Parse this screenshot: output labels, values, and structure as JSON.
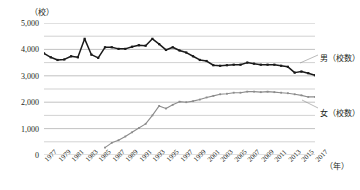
{
  "axis": {
    "unit_top": "（校）",
    "unit_right": "（年）",
    "y_ticks": [
      "5,000",
      "4,000",
      "3,000",
      "2,000",
      "1,000",
      "0"
    ],
    "y_tick_values": [
      5000,
      4000,
      3000,
      2000,
      1000,
      0
    ],
    "x_ticks": [
      "1977",
      "1979",
      "1981",
      "1983",
      "1985",
      "1987",
      "1989",
      "1991",
      "1993",
      "1995",
      "1997",
      "1999",
      "2001",
      "2003",
      "2005",
      "2007",
      "2009",
      "2011",
      "2013",
      "2015",
      "2017"
    ]
  },
  "legend": {
    "male": "男（校数）",
    "female": "女（校数）"
  },
  "colors": {
    "male_line": "#1a1a1a",
    "female_line": "#8c8c8c",
    "gridline": "#b3b3b3",
    "background": "#ffffff",
    "text": "#231f20"
  },
  "chart_data": {
    "type": "line",
    "title": "",
    "xlabel": "（年）",
    "ylabel": "（校）",
    "xlim": [
      1977,
      2017
    ],
    "ylim": [
      0,
      5000
    ],
    "grid": true,
    "grid_major_step": 1000,
    "grid_minor_step": 500,
    "legend_position": "right-inline-labels",
    "x": [
      1977,
      1978,
      1979,
      1980,
      1981,
      1982,
      1983,
      1984,
      1985,
      1986,
      1987,
      1988,
      1989,
      1990,
      1991,
      1992,
      1993,
      1994,
      1995,
      1996,
      1997,
      1998,
      1999,
      2000,
      2001,
      2002,
      2003,
      2004,
      2005,
      2006,
      2007,
      2008,
      2009,
      2010,
      2011,
      2012,
      2013,
      2014,
      2015,
      2016,
      2017
    ],
    "series": [
      {
        "name": "男（校数）",
        "color": "#1a1a1a",
        "marker": "square",
        "values": [
          3850,
          3700,
          3600,
          3620,
          3740,
          3700,
          4400,
          3800,
          3680,
          4080,
          4080,
          4020,
          4020,
          4100,
          4160,
          4140,
          4400,
          4200,
          3980,
          4080,
          3960,
          3880,
          3740,
          3600,
          3560,
          3400,
          3380,
          3400,
          3420,
          3420,
          3500,
          3460,
          3420,
          3420,
          3420,
          3380,
          3340,
          3120,
          3160,
          3100,
          3020
        ]
      },
      {
        "name": "女（校数）",
        "color": "#8c8c8c",
        "marker": "square",
        "values": [
          null,
          null,
          null,
          null,
          null,
          null,
          null,
          null,
          null,
          280,
          460,
          560,
          700,
          860,
          1020,
          1180,
          1500,
          1860,
          1760,
          1900,
          2020,
          2000,
          2040,
          2100,
          2180,
          2240,
          2300,
          2320,
          2360,
          2360,
          2400,
          2400,
          2380,
          2400,
          2380,
          2360,
          2340,
          2300,
          2260,
          2200,
          2200
        ]
      }
    ]
  }
}
